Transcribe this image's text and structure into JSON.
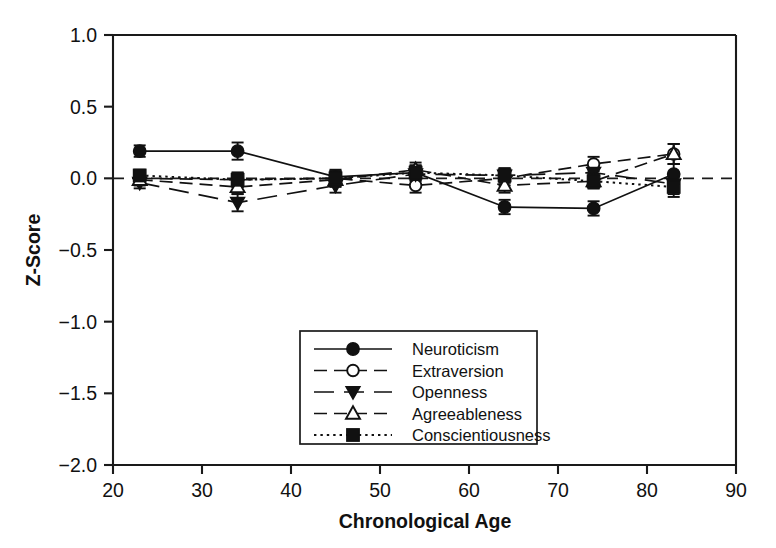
{
  "chart_data": {
    "type": "line",
    "title": "",
    "xlabel": "Chronological Age",
    "ylabel": "Z-Score",
    "x": [
      23,
      34,
      45,
      54,
      64,
      74,
      83
    ],
    "xlim": [
      20,
      90
    ],
    "ylim": [
      -2.0,
      1.0
    ],
    "xticks": [
      20,
      30,
      40,
      50,
      60,
      70,
      80,
      90
    ],
    "xticklabels": [
      "20",
      "30",
      "40",
      "50",
      "60",
      "70",
      "80",
      "90"
    ],
    "yticks": [
      1.0,
      0.5,
      0.0,
      -0.5,
      -1.0,
      -1.5,
      -2.0
    ],
    "yticklabels": [
      "1.0",
      "0.5",
      "0.0",
      "−0.5",
      "−1.0",
      "−1.5",
      "−2.0"
    ],
    "grid": false,
    "reference_line": {
      "y": 0.0,
      "style": "dashed"
    },
    "legend_position": "lower-center",
    "error_bars": "standard error",
    "series": [
      {
        "name": "Neuroticism",
        "marker": "filled-circle",
        "line_style": "solid",
        "values": [
          0.19,
          0.19,
          0.01,
          0.04,
          -0.2,
          -0.21,
          0.03
        ],
        "errors": [
          0.04,
          0.06,
          0.05,
          0.05,
          0.05,
          0.05,
          0.07
        ]
      },
      {
        "name": "Extraversion",
        "marker": "open-circle",
        "line_style": "dashed",
        "values": [
          0.0,
          -0.01,
          0.0,
          -0.05,
          0.0,
          0.1,
          0.17
        ],
        "errors": [
          0.04,
          0.05,
          0.05,
          0.05,
          0.05,
          0.05,
          0.07
        ]
      },
      {
        "name": "Openness",
        "marker": "filled-triangle-down",
        "line_style": "long-dash",
        "values": [
          -0.03,
          -0.17,
          -0.05,
          0.03,
          0.02,
          0.04,
          -0.04
        ],
        "errors": [
          0.04,
          0.06,
          0.05,
          0.05,
          0.05,
          0.05,
          0.07
        ]
      },
      {
        "name": "Agreeableness",
        "marker": "open-triangle-up",
        "line_style": "dashed",
        "values": [
          -0.01,
          -0.06,
          -0.01,
          0.06,
          -0.05,
          -0.02,
          0.17
        ],
        "errors": [
          0.04,
          0.05,
          0.05,
          0.05,
          0.05,
          0.05,
          0.07
        ]
      },
      {
        "name": "Conscientiousness",
        "marker": "filled-square",
        "line_style": "dotted",
        "values": [
          0.02,
          -0.01,
          0.0,
          0.04,
          0.02,
          -0.02,
          -0.06
        ],
        "errors": [
          0.04,
          0.05,
          0.05,
          0.05,
          0.05,
          0.05,
          0.07
        ]
      }
    ]
  },
  "axes": {
    "x_title": "Chronological Age",
    "y_title": "Z-Score"
  },
  "legend": {
    "items": [
      {
        "label": "Neuroticism"
      },
      {
        "label": "Extraversion"
      },
      {
        "label": "Openness"
      },
      {
        "label": "Agreeableness"
      },
      {
        "label": "Conscientiousness"
      }
    ]
  },
  "colors": {
    "ink": "#111111",
    "background": "#ffffff"
  }
}
